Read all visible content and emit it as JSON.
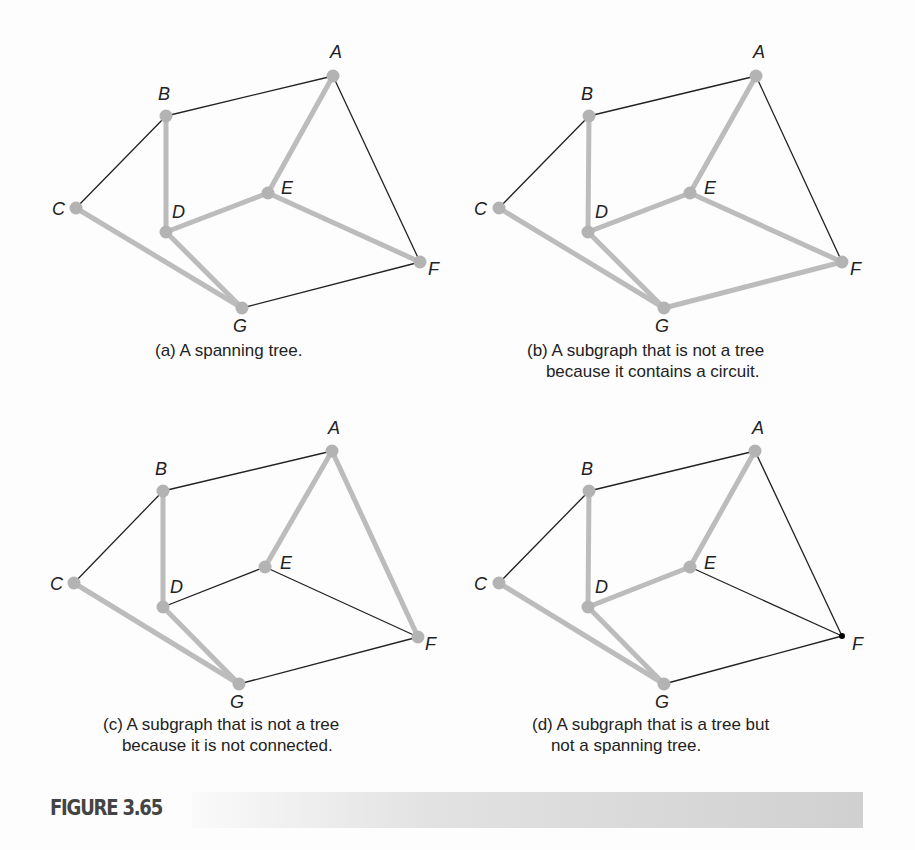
{
  "figure": {
    "number": "FIGURE 3.65",
    "style": {
      "thick_edge_color": "#bcbcbc",
      "thin_edge_color": "#222222",
      "node_color": "#b3b3b3",
      "highlight_node_dot_color": "#000000"
    }
  },
  "panels": [
    {
      "id": "a",
      "caption": [
        "(a) A spanning tree."
      ],
      "caption_pos": [
        155,
        340
      ],
      "nodes": {
        "A": {
          "xy": [
            333,
            76
          ],
          "label_xy": [
            330,
            58
          ]
        },
        "B": {
          "xy": [
            166,
            116
          ],
          "label_xy": [
            158,
            100
          ]
        },
        "C": {
          "xy": [
            76,
            208
          ],
          "label_xy": [
            52,
            215
          ]
        },
        "D": {
          "xy": [
            166,
            232
          ],
          "label_xy": [
            172,
            218
          ]
        },
        "E": {
          "xy": [
            268,
            193
          ],
          "label_xy": [
            281,
            194
          ]
        },
        "F": {
          "xy": [
            420,
            262
          ],
          "label_xy": [
            428,
            275
          ]
        },
        "G": {
          "xy": [
            242,
            308
          ],
          "label_xy": [
            233,
            332
          ]
        }
      },
      "thick_edges": [
        [
          "B",
          "D"
        ],
        [
          "A",
          "E"
        ],
        [
          "D",
          "E"
        ],
        [
          "E",
          "F"
        ],
        [
          "C",
          "G"
        ],
        [
          "D",
          "G"
        ]
      ],
      "thin_edges": [
        [
          "B",
          "A"
        ],
        [
          "B",
          "C"
        ],
        [
          "A",
          "F"
        ],
        [
          "G",
          "F"
        ]
      ]
    },
    {
      "id": "b",
      "caption": [
        "(b) A subgraph that is not a tree",
        "    because it contains a circuit."
      ],
      "caption_pos": [
        527,
        340
      ],
      "nodes": {
        "A": {
          "xy": [
            756,
            76
          ],
          "label_xy": [
            753,
            58
          ]
        },
        "B": {
          "xy": [
            589,
            116
          ],
          "label_xy": [
            581,
            100
          ]
        },
        "C": {
          "xy": [
            499,
            208
          ],
          "label_xy": [
            474,
            215
          ]
        },
        "D": {
          "xy": [
            588,
            232
          ],
          "label_xy": [
            595,
            218
          ]
        },
        "E": {
          "xy": [
            690,
            193
          ],
          "label_xy": [
            704,
            194
          ]
        },
        "F": {
          "xy": [
            842,
            262
          ],
          "label_xy": [
            850,
            275
          ]
        },
        "G": {
          "xy": [
            664,
            308
          ],
          "label_xy": [
            655,
            332
          ]
        }
      },
      "thick_edges": [
        [
          "B",
          "D"
        ],
        [
          "A",
          "E"
        ],
        [
          "D",
          "E"
        ],
        [
          "E",
          "F"
        ],
        [
          "C",
          "G"
        ],
        [
          "D",
          "G"
        ],
        [
          "G",
          "F"
        ]
      ],
      "thin_edges": [
        [
          "B",
          "A"
        ],
        [
          "B",
          "C"
        ],
        [
          "A",
          "F"
        ]
      ]
    },
    {
      "id": "c",
      "caption": [
        "(c) A subgraph that is not a tree",
        "    because it is not connected."
      ],
      "caption_pos": [
        103,
        714
      ],
      "nodes": {
        "A": {
          "xy": [
            332,
            451
          ],
          "label_xy": [
            328,
            434
          ]
        },
        "B": {
          "xy": [
            163,
            491
          ],
          "label_xy": [
            155,
            475
          ]
        },
        "C": {
          "xy": [
            74,
            583
          ],
          "label_xy": [
            50,
            590
          ]
        },
        "D": {
          "xy": [
            163,
            607
          ],
          "label_xy": [
            170,
            593
          ]
        },
        "E": {
          "xy": [
            265,
            567
          ],
          "label_xy": [
            280,
            569
          ]
        },
        "F": {
          "xy": [
            418,
            637
          ],
          "label_xy": [
            425,
            650
          ]
        },
        "G": {
          "xy": [
            239,
            684
          ],
          "label_xy": [
            230,
            708
          ]
        }
      },
      "thick_edges": [
        [
          "B",
          "D"
        ],
        [
          "A",
          "E"
        ],
        [
          "A",
          "F"
        ],
        [
          "C",
          "G"
        ],
        [
          "D",
          "G"
        ]
      ],
      "thin_edges": [
        [
          "B",
          "A"
        ],
        [
          "B",
          "C"
        ],
        [
          "D",
          "E"
        ],
        [
          "E",
          "F"
        ],
        [
          "G",
          "F"
        ]
      ]
    },
    {
      "id": "d",
      "caption": [
        "(d) A subgraph that is a tree but",
        "    not a spanning tree."
      ],
      "caption_pos": [
        532,
        714
      ],
      "nodes": {
        "A": {
          "xy": [
            755,
            451
          ],
          "label_xy": [
            752,
            434
          ]
        },
        "B": {
          "xy": [
            589,
            491
          ],
          "label_xy": [
            581,
            475
          ]
        },
        "C": {
          "xy": [
            499,
            583
          ],
          "label_xy": [
            474,
            590
          ]
        },
        "D": {
          "xy": [
            588,
            607
          ],
          "label_xy": [
            595,
            593
          ]
        },
        "E": {
          "xy": [
            690,
            567
          ],
          "label_xy": [
            704,
            569
          ]
        },
        "F": {
          "xy": [
            842,
            636
          ],
          "label_xy": [
            852,
            650
          ],
          "dot": true
        },
        "G": {
          "xy": [
            664,
            684
          ],
          "label_xy": [
            655,
            708
          ]
        }
      },
      "thick_edges": [
        [
          "B",
          "D"
        ],
        [
          "A",
          "E"
        ],
        [
          "D",
          "E"
        ],
        [
          "C",
          "G"
        ],
        [
          "D",
          "G"
        ]
      ],
      "thin_edges": [
        [
          "B",
          "A"
        ],
        [
          "B",
          "C"
        ],
        [
          "A",
          "F"
        ],
        [
          "E",
          "F"
        ],
        [
          "G",
          "F"
        ]
      ]
    }
  ]
}
